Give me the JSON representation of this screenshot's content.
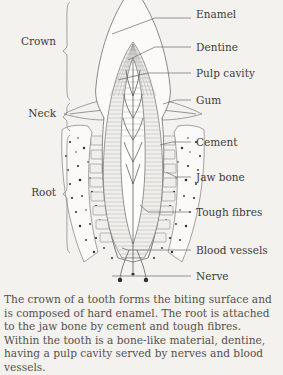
{
  "figure": {
    "background_color": "#f4f2ee",
    "ink_color": "#3b3b3b",
    "side_brackets": [
      {
        "name": "crown",
        "label": "Crown",
        "label_x": 56,
        "label_y": 45,
        "top": 2,
        "bottom": 100
      },
      {
        "name": "neck",
        "label": "Neck",
        "label_x": 56,
        "label_y": 117,
        "top": 103,
        "bottom": 131
      },
      {
        "name": "root",
        "label": "Root",
        "label_x": 56,
        "label_y": 196,
        "top": 135,
        "bottom": 253
      }
    ],
    "callouts": [
      {
        "name": "enamel",
        "label": "Enamel",
        "text_x": 196,
        "text_y": 18,
        "line_x1": 155,
        "line_y1": 18,
        "line_x2": 191,
        "line_y2": 18,
        "tip_x": 112,
        "tip_y": 34
      },
      {
        "name": "dentine",
        "label": "Dentine",
        "text_x": 196,
        "text_y": 51,
        "line_x1": 155,
        "line_y1": 47,
        "line_x2": 191,
        "line_y2": 47,
        "tip_x": 128,
        "tip_y": 60
      },
      {
        "name": "pulp-cavity",
        "label": "Pulp cavity",
        "text_x": 196,
        "text_y": 77,
        "line_x1": 148,
        "line_y1": 73,
        "line_x2": 191,
        "line_y2": 73,
        "tip_x": 118,
        "tip_y": 80
      },
      {
        "name": "gum",
        "label": "Gum",
        "text_x": 196,
        "text_y": 104,
        "line_x1": 176,
        "line_y1": 100,
        "line_x2": 191,
        "line_y2": 100,
        "tip_x": 163,
        "tip_y": 104
      },
      {
        "name": "cement",
        "label": "Cement",
        "text_x": 196,
        "text_y": 146,
        "line_x1": 172,
        "line_y1": 142,
        "line_x2": 191,
        "line_y2": 142,
        "tip_x": 160,
        "tip_y": 145
      },
      {
        "name": "jaw-bone",
        "label": "Jaw bone",
        "text_x": 196,
        "text_y": 181,
        "line_x1": 176,
        "line_y1": 177,
        "line_x2": 191,
        "line_y2": 177,
        "tip_x": 166,
        "tip_y": 172
      },
      {
        "name": "tough-fibres",
        "label": "Tough fibres",
        "text_x": 196,
        "text_y": 216,
        "line_x1": 148,
        "line_y1": 212,
        "line_x2": 191,
        "line_y2": 212,
        "tip_x": 140,
        "tip_y": 205
      },
      {
        "name": "blood-vessels",
        "label": "Blood vessels",
        "text_x": 196,
        "text_y": 254,
        "line_x1": 128,
        "line_y1": 250,
        "line_x2": 191,
        "line_y2": 250,
        "tip_x": 122,
        "tip_y": 248
      },
      {
        "name": "nerve",
        "label": "Nerve",
        "text_x": 196,
        "text_y": 280,
        "line_x1": 116,
        "line_y1": 276,
        "line_x2": 191,
        "line_y2": 276,
        "tip_x": 112,
        "tip_y": 276
      }
    ]
  },
  "caption": {
    "text": "The crown of a tooth forms the biting surface and is composed of hard enamel. The root is attached to the jaw bone by cement and tough fibres. Within the tooth is a bone-like material, dentine, having a pulp cavity served by nerves and blood vessels."
  }
}
